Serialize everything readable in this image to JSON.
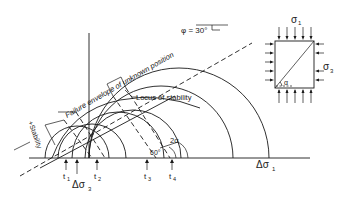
{
  "diagram": {
    "labels": {
      "phi": "φ = 30°",
      "failure_envelope": "Failure envelope of unknown position",
      "locus": "Locus of stability",
      "stability": "+Stability",
      "angle_60": "60°",
      "two_alpha": "2α",
      "t1": "t",
      "t1_sub": "1",
      "t2": "t",
      "t2_sub": "2",
      "t3": "t",
      "t3_sub": "3",
      "t4": "t",
      "t4_sub": "4",
      "delta_sigma3": "Δσ",
      "delta_sigma3_sub": "3",
      "delta_sigma1": "Δσ",
      "delta_sigma1_sub": "1"
    },
    "element": {
      "sigma1": "σ",
      "sigma1_sub": "1",
      "sigma3": "σ",
      "sigma3_sub": "3",
      "alpha": "α"
    }
  }
}
